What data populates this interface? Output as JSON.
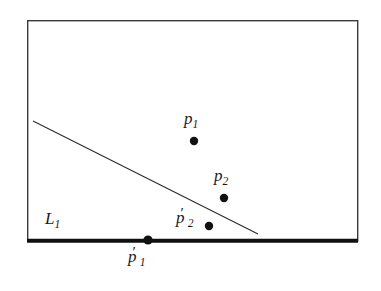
{
  "figure": {
    "type": "geometry-diagram",
    "background_color": "#ffffff",
    "ink_color": "#1a1a1a"
  },
  "rectangle": {
    "name": "bounding-rectangle",
    "x": 27,
    "y": 20,
    "width": 331,
    "height": 221,
    "border_color": "#3a3a3a",
    "border_width": 1.4,
    "bottom_edge": {
      "name": "thick-bottom-edge",
      "x1": 27,
      "y1": 241,
      "x2": 358,
      "y2": 241,
      "width": 4,
      "color": "#111111"
    }
  },
  "diagonal_line": {
    "name": "line-L1",
    "x1": 33,
    "y1": 121,
    "x2": 258,
    "y2": 234,
    "width": 1.1,
    "color": "#2b2b2b"
  },
  "points": [
    {
      "id": "p1",
      "label_text": "p",
      "subscript": "1",
      "prime": false,
      "cx": 194,
      "cy": 141,
      "r": 4.2,
      "color": "#111111"
    },
    {
      "id": "p2",
      "label_text": "p",
      "subscript": "2",
      "prime": false,
      "cx": 224,
      "cy": 198,
      "r": 4.2,
      "color": "#111111"
    },
    {
      "id": "p2p",
      "label_text": "p",
      "subscript": "2",
      "prime": true,
      "cx": 209,
      "cy": 226,
      "r": 4.2,
      "color": "#111111"
    },
    {
      "id": "p1p",
      "label_text": "p",
      "subscript": "1",
      "prime": true,
      "cx": 148,
      "cy": 240,
      "r": 4.6,
      "color": "#111111"
    }
  ],
  "labels": {
    "p1": {
      "base": "p",
      "sub": "1",
      "prime": ""
    },
    "p2": {
      "base": "p",
      "sub": "2",
      "prime": ""
    },
    "p2p": {
      "base": "p",
      "sub": "2",
      "prime": "′"
    },
    "p1p": {
      "base": "p",
      "sub": "1",
      "prime": "′"
    },
    "L1": {
      "base": "L",
      "sub": "1",
      "prime": ""
    }
  }
}
